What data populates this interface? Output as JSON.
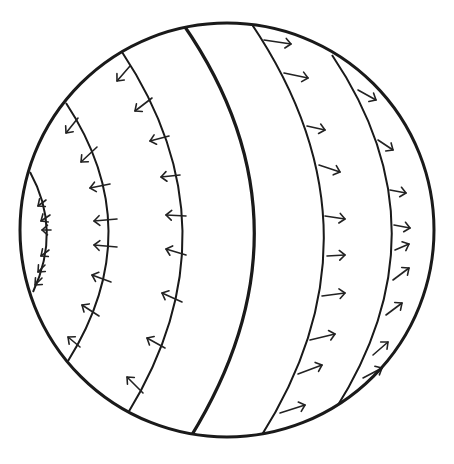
{
  "diagram": {
    "colors": {
      "background": "#ffffff",
      "ink": "#1a1a1a"
    },
    "sphere": {
      "cx": 227,
      "cy": 230,
      "r": 207
    },
    "bands": [
      {
        "id": "A",
        "path": "M30 172 Q62 230 33 292",
        "thick": false
      },
      {
        "id": "B",
        "path": "M66 103 Q150 230 68 361",
        "thick": false
      },
      {
        "id": "C",
        "path": "M122 52 Q240 230 128 413",
        "thick": false
      },
      {
        "id": "D",
        "path": "M183 24 Q322 225 190 438",
        "thick": true
      },
      {
        "id": "E",
        "path": "M251 23 Q392 232 260 438",
        "thick": false
      },
      {
        "id": "F",
        "path": "M332 55 Q450 230 335 410",
        "thick": false
      }
    ],
    "arrows": [
      {
        "band": "A",
        "direction": "left",
        "x1": 46,
        "y1": 200,
        "x2": 38,
        "y2": 206
      },
      {
        "band": "A",
        "direction": "left",
        "x1": 50,
        "y1": 215,
        "x2": 41,
        "y2": 221
      },
      {
        "band": "A",
        "direction": "left",
        "x1": 51,
        "y1": 230,
        "x2": 42,
        "y2": 230
      },
      {
        "band": "A",
        "direction": "left",
        "x1": 49,
        "y1": 250,
        "x2": 41,
        "y2": 256
      },
      {
        "band": "A",
        "direction": "left",
        "x1": 45,
        "y1": 265,
        "x2": 38,
        "y2": 272
      },
      {
        "band": "A",
        "direction": "left",
        "x1": 42,
        "y1": 278,
        "x2": 35,
        "y2": 285
      },
      {
        "band": "B",
        "direction": "left",
        "x1": 78,
        "y1": 118,
        "x2": 66,
        "y2": 133
      },
      {
        "band": "B",
        "direction": "left",
        "x1": 97,
        "y1": 147,
        "x2": 81,
        "y2": 162
      },
      {
        "band": "B",
        "direction": "left",
        "x1": 110,
        "y1": 184,
        "x2": 90,
        "y2": 188
      },
      {
        "band": "B",
        "direction": "left",
        "x1": 117,
        "y1": 219,
        "x2": 94,
        "y2": 221
      },
      {
        "band": "B",
        "direction": "left",
        "x1": 117,
        "y1": 247,
        "x2": 94,
        "y2": 245
      },
      {
        "band": "B",
        "direction": "left",
        "x1": 111,
        "y1": 282,
        "x2": 92,
        "y2": 275
      },
      {
        "band": "B",
        "direction": "left",
        "x1": 99,
        "y1": 316,
        "x2": 82,
        "y2": 305
      },
      {
        "band": "B",
        "direction": "left",
        "x1": 80,
        "y1": 347,
        "x2": 68,
        "y2": 337
      },
      {
        "band": "C",
        "direction": "left",
        "x1": 130,
        "y1": 66,
        "x2": 117,
        "y2": 81
      },
      {
        "band": "C",
        "direction": "left",
        "x1": 152,
        "y1": 98,
        "x2": 135,
        "y2": 111
      },
      {
        "band": "C",
        "direction": "left",
        "x1": 169,
        "y1": 136,
        "x2": 150,
        "y2": 141
      },
      {
        "band": "C",
        "direction": "left",
        "x1": 180,
        "y1": 175,
        "x2": 161,
        "y2": 177
      },
      {
        "band": "C",
        "direction": "left",
        "x1": 186,
        "y1": 216,
        "x2": 166,
        "y2": 215
      },
      {
        "band": "C",
        "direction": "left",
        "x1": 186,
        "y1": 255,
        "x2": 166,
        "y2": 249
      },
      {
        "band": "C",
        "direction": "left",
        "x1": 182,
        "y1": 302,
        "x2": 162,
        "y2": 293
      },
      {
        "band": "C",
        "direction": "left",
        "x1": 165,
        "y1": 348,
        "x2": 147,
        "y2": 338
      },
      {
        "band": "C",
        "direction": "left",
        "x1": 143,
        "y1": 393,
        "x2": 127,
        "y2": 377
      },
      {
        "band": "E",
        "direction": "right",
        "x1": 264,
        "y1": 40,
        "x2": 291,
        "y2": 44
      },
      {
        "band": "E",
        "direction": "right",
        "x1": 284,
        "y1": 73,
        "x2": 308,
        "y2": 78
      },
      {
        "band": "E",
        "direction": "right",
        "x1": 307,
        "y1": 126,
        "x2": 325,
        "y2": 130
      },
      {
        "band": "E",
        "direction": "right",
        "x1": 319,
        "y1": 165,
        "x2": 340,
        "y2": 172
      },
      {
        "band": "E",
        "direction": "right",
        "x1": 325,
        "y1": 216,
        "x2": 345,
        "y2": 219
      },
      {
        "band": "E",
        "direction": "right",
        "x1": 327,
        "y1": 256,
        "x2": 345,
        "y2": 255
      },
      {
        "band": "E",
        "direction": "right",
        "x1": 322,
        "y1": 296,
        "x2": 345,
        "y2": 293
      },
      {
        "band": "E",
        "direction": "right",
        "x1": 310,
        "y1": 340,
        "x2": 335,
        "y2": 334
      },
      {
        "band": "E",
        "direction": "right",
        "x1": 298,
        "y1": 374,
        "x2": 322,
        "y2": 365
      },
      {
        "band": "E",
        "direction": "right",
        "x1": 280,
        "y1": 413,
        "x2": 305,
        "y2": 405
      },
      {
        "band": "F",
        "direction": "right",
        "x1": 358,
        "y1": 90,
        "x2": 376,
        "y2": 100
      },
      {
        "band": "F",
        "direction": "right",
        "x1": 378,
        "y1": 140,
        "x2": 393,
        "y2": 150
      },
      {
        "band": "F",
        "direction": "right",
        "x1": 390,
        "y1": 190,
        "x2": 406,
        "y2": 193
      },
      {
        "band": "F",
        "direction": "right",
        "x1": 394,
        "y1": 225,
        "x2": 410,
        "y2": 228
      },
      {
        "band": "F",
        "direction": "right",
        "x1": 395,
        "y1": 250,
        "x2": 409,
        "y2": 244
      },
      {
        "band": "F",
        "direction": "right",
        "x1": 393,
        "y1": 280,
        "x2": 409,
        "y2": 268
      },
      {
        "band": "F",
        "direction": "right",
        "x1": 386,
        "y1": 315,
        "x2": 402,
        "y2": 303
      },
      {
        "band": "F",
        "direction": "right",
        "x1": 373,
        "y1": 355,
        "x2": 388,
        "y2": 342
      },
      {
        "band": "F",
        "direction": "right",
        "x1": 363,
        "y1": 378,
        "x2": 382,
        "y2": 368
      }
    ]
  }
}
